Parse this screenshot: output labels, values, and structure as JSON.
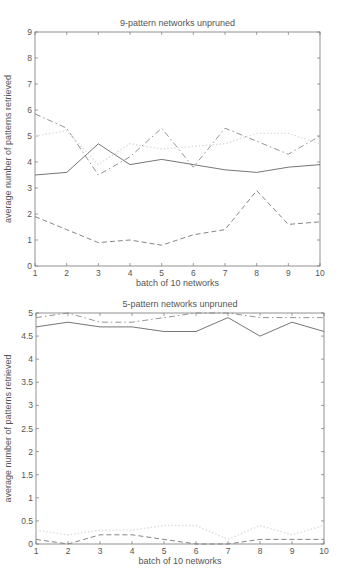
{
  "chart_data": [
    {
      "type": "line",
      "title": "9-pattern networks unpruned",
      "xlabel": "batch of 10 networks",
      "ylabel": "average number of patterns retrieved",
      "x": [
        1,
        2,
        3,
        4,
        5,
        6,
        7,
        8,
        9,
        10
      ],
      "xlim": [
        1,
        10
      ],
      "ylim": [
        0,
        9
      ],
      "xticks": [
        "1",
        "2",
        "3",
        "4",
        "5",
        "6",
        "7",
        "8",
        "9",
        "10"
      ],
      "yticks": [
        "0",
        "1",
        "2",
        "3",
        "4",
        "5",
        "6",
        "7",
        "8",
        "9"
      ],
      "grid": false,
      "legend": null,
      "series": [
        {
          "name": "solid",
          "style": "solid",
          "color": "#666666",
          "values": [
            3.5,
            3.6,
            4.7,
            3.9,
            4.1,
            3.9,
            3.7,
            3.6,
            3.8,
            3.9
          ]
        },
        {
          "name": "dash-dot",
          "style": "dashdot",
          "color": "#888888",
          "values": [
            5.85,
            5.3,
            3.5,
            4.2,
            5.3,
            3.8,
            5.3,
            4.8,
            4.3,
            5.0
          ]
        },
        {
          "name": "dashed",
          "style": "dashed",
          "color": "#777777",
          "values": [
            1.9,
            1.4,
            0.9,
            1.0,
            0.8,
            1.2,
            1.4,
            2.9,
            1.6,
            1.7
          ]
        },
        {
          "name": "dotted",
          "style": "dotted",
          "color": "#dddddd",
          "values": [
            5.0,
            5.2,
            3.9,
            4.7,
            4.5,
            4.6,
            4.7,
            5.1,
            5.1,
            4.7
          ]
        }
      ]
    },
    {
      "type": "line",
      "title": "5-pattern networks unpruned",
      "xlabel": "batch of 10 networks",
      "ylabel": "average number of patterns retrieved",
      "x": [
        1,
        2,
        3,
        4,
        5,
        6,
        7,
        8,
        9,
        10
      ],
      "xlim": [
        1,
        10
      ],
      "ylim": [
        0,
        5
      ],
      "xticks": [
        "1",
        "2",
        "3",
        "4",
        "5",
        "6",
        "7",
        "8",
        "9",
        "10"
      ],
      "yticks": [
        "0",
        "0.5",
        "1",
        "1.5",
        "2",
        "2.5",
        "3",
        "3.5",
        "4",
        "4.5",
        "5"
      ],
      "grid": false,
      "legend": null,
      "series": [
        {
          "name": "solid",
          "style": "solid",
          "color": "#666666",
          "values": [
            4.7,
            4.8,
            4.7,
            4.7,
            4.6,
            4.6,
            4.9,
            4.5,
            4.8,
            4.6
          ]
        },
        {
          "name": "dash-dot",
          "style": "dashdot",
          "color": "#888888",
          "values": [
            4.9,
            5.0,
            4.8,
            4.8,
            4.9,
            5.0,
            5.0,
            4.9,
            4.9,
            4.9
          ]
        },
        {
          "name": "dashed",
          "style": "dashed",
          "color": "#777777",
          "values": [
            0.1,
            0.0,
            0.2,
            0.2,
            0.1,
            0.0,
            0.0,
            0.1,
            0.1,
            0.1
          ]
        },
        {
          "name": "dotted",
          "style": "dotted",
          "color": "#dddddd",
          "values": [
            0.3,
            0.2,
            0.3,
            0.3,
            0.4,
            0.4,
            0.1,
            0.4,
            0.2,
            0.4
          ]
        }
      ]
    }
  ],
  "layout": {
    "plots": [
      {
        "left": 35,
        "top": 32,
        "right": 320,
        "bottom": 266
      },
      {
        "left": 36,
        "top": 313,
        "right": 324,
        "bottom": 544
      }
    ]
  }
}
